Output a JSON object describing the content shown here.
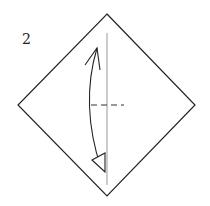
{
  "diagram": {
    "type": "origami-step",
    "step_number": "2",
    "paper": {
      "shape": "square-diamond",
      "points": {
        "top": [
          107,
          14
        ],
        "right": [
          195,
          105
        ],
        "bottom": [
          107,
          196
        ],
        "left": [
          18,
          105
        ]
      },
      "stroke": "#222222"
    },
    "center_crease": {
      "x": 107,
      "y1": 33,
      "y2": 185,
      "stroke": "#999999"
    },
    "valley_fold_line": {
      "y": 105,
      "x1": 91,
      "x2": 123,
      "style": "dashed"
    },
    "fold_arrow": {
      "direction": "fold-and-unfold",
      "start": [
        97,
        48
      ],
      "end": [
        101,
        170
      ],
      "bow_x": 88
    }
  }
}
